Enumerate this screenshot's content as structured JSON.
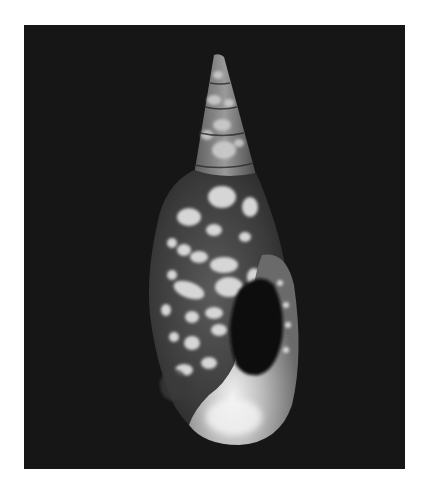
{
  "image": {
    "subject": "spotted gastropod shell (mitra-like), aperture facing viewer",
    "background_color": "#161616",
    "page_background": "#ffffff",
    "shell_base_color": "#4a4a4a",
    "spot_color": "#d8d8d8",
    "aperture_lip_color": "#bdbdbd",
    "aperture_interior_color": "#0e0e0e"
  }
}
